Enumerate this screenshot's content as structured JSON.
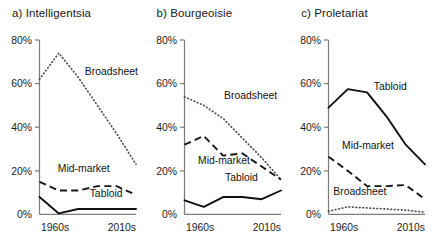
{
  "chart_data": {
    "type": "line",
    "xlabel": "",
    "ylabel": "",
    "x": [
      "1960s",
      "1970s",
      "1980s",
      "1990s",
      "2000s",
      "2010s"
    ],
    "xtick_labels": [
      "1960s",
      "2010s"
    ],
    "ytick_labels": [
      "0%",
      "20%",
      "40%",
      "60%",
      "80%"
    ],
    "ytick_values": [
      0,
      20,
      40,
      60,
      80
    ],
    "ylim": [
      0,
      80
    ],
    "grid": false,
    "legend": "inline-annotations",
    "panels": [
      {
        "key": "intelligentsia",
        "label": "a) Intelligentsia",
        "series": [
          {
            "name": "Broadsheet",
            "style": "dotted",
            "values": [
              62,
              74,
              63,
              50,
              37,
              23
            ],
            "label_x_frac": 0.47,
            "label_y_pct": 64
          },
          {
            "name": "Mid-market",
            "style": "dashed",
            "values": [
              15,
              11,
              11,
              13,
              13,
              9
            ],
            "label_x_frac": 0.19,
            "label_y_pct": 19.5
          },
          {
            "name": "Tabloid",
            "style": "solid",
            "values": [
              8,
              0.5,
              2.5,
              2.5,
              2.5,
              2.5
            ],
            "label_x_frac": 0.52,
            "label_y_pct": 8
          }
        ]
      },
      {
        "key": "bourgeoisie",
        "label": "b) Bourgeoisie",
        "series": [
          {
            "name": "Broadsheet",
            "style": "dotted",
            "values": [
              54,
              50,
              44,
              35,
              26,
              16
            ],
            "label_x_frac": 0.41,
            "label_y_pct": 53
          },
          {
            "name": "Mid-market",
            "style": "dashed",
            "values": [
              32,
              36,
              27,
              28,
              22,
              16
            ],
            "label_x_frac": 0.14,
            "label_y_pct": 23
          },
          {
            "name": "Tabloid",
            "style": "solid",
            "values": [
              6.5,
              3.5,
              8,
              8,
              7,
              11
            ],
            "label_x_frac": 0.42,
            "label_y_pct": 15.5
          }
        ]
      },
      {
        "key": "proletariat",
        "label": "c) Proletariat",
        "series": [
          {
            "name": "Tabloid",
            "style": "solid",
            "values": [
              49,
              57.5,
              56,
              45,
              32,
              23
            ],
            "label_x_frac": 0.47,
            "label_y_pct": 57
          },
          {
            "name": "Mid-market",
            "style": "dashed",
            "values": [
              26.5,
              20,
              13,
              13,
              13.5,
              7
            ],
            "label_x_frac": 0.14,
            "label_y_pct": 30
          },
          {
            "name": "Broadsheet",
            "style": "dotted",
            "values": [
              1.5,
              3.5,
              3,
              2.5,
              2,
              1
            ],
            "label_x_frac": 0.05,
            "label_y_pct": 9
          }
        ]
      }
    ]
  }
}
